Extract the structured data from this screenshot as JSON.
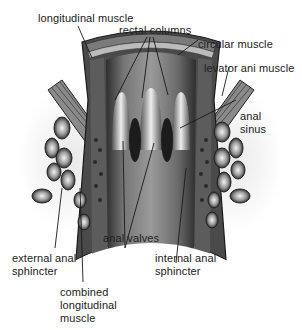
{
  "figure": {
    "labels": {
      "longitudinal_muscle": "longitudinal muscle",
      "rectal_columns": "rectal columns",
      "circular_muscle": "circular muscle",
      "levator_ani_muscle": "levator ani muscle",
      "anal_sinus": "anal\nsinus",
      "anal_valves": "anal valves",
      "internal_anal_sphincter": "internal anal\nsphincter",
      "external_anal_sphincter": "external anal\nsphincter",
      "combined_longitudinal_muscle": "combined\nlongitudinal\nmuscle"
    },
    "colors": {
      "background": "#ffffff",
      "text": "#222222",
      "leader_line": "#1a1a1a",
      "wall_dark": "#3a3a3a",
      "wall_mid": "#6e6e6e",
      "lumen_light": "#a8a8a8",
      "column_highlight": "#e6e6e6"
    }
  }
}
